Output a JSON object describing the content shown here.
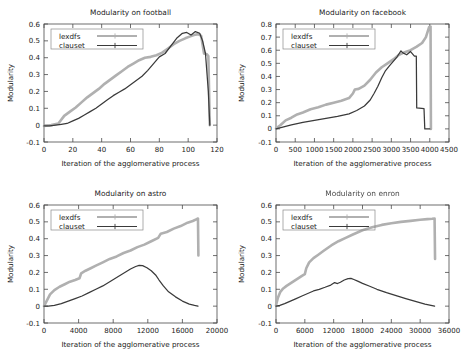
{
  "figure": {
    "panel_count": 4,
    "series_names": [
      "lexdfs",
      "clauset"
    ],
    "colors": {
      "lexdfs": "#b0b0b0",
      "clauset": "#3a3a3a",
      "axis": "#4a4a4a",
      "background": "#ffffff"
    }
  },
  "chart_data": [
    {
      "type": "line",
      "title": "Modularity on football",
      "xlabel": "Iteration of the agglomerative process",
      "ylabel": "Modularity",
      "xlim": [
        0,
        120
      ],
      "ylim": [
        -0.1,
        0.6
      ],
      "xticks": [
        0,
        20,
        40,
        60,
        80,
        100,
        120
      ],
      "yticks": [
        -0.1,
        0,
        0.1,
        0.2,
        0.3,
        0.4,
        0.5,
        0.6
      ],
      "grid": false,
      "legend_position": "top-left",
      "series": [
        {
          "name": "lexdfs",
          "x": [
            0,
            5,
            10,
            14,
            18,
            22,
            26,
            30,
            34,
            38,
            42,
            46,
            50,
            54,
            58,
            62,
            66,
            70,
            74,
            78,
            82,
            86,
            90,
            94,
            98,
            101,
            104,
            107,
            109,
            111,
            113,
            114,
            115
          ],
          "y": [
            -0.005,
            0.0,
            0.01,
            0.055,
            0.08,
            0.105,
            0.135,
            0.165,
            0.19,
            0.215,
            0.245,
            0.27,
            0.295,
            0.32,
            0.345,
            0.365,
            0.385,
            0.4,
            0.405,
            0.415,
            0.43,
            0.455,
            0.48,
            0.5,
            0.515,
            0.525,
            0.535,
            0.54,
            0.53,
            0.425,
            0.42,
            0.41,
            0.0
          ]
        },
        {
          "name": "clauset",
          "x": [
            0,
            4,
            8,
            12,
            16,
            20,
            24,
            28,
            32,
            36,
            40,
            44,
            48,
            52,
            56,
            60,
            64,
            68,
            72,
            76,
            80,
            84,
            88,
            92,
            96,
            99,
            102,
            105,
            108,
            110,
            112,
            114,
            115
          ],
          "y": [
            -0.005,
            -0.005,
            0.0,
            0.005,
            0.01,
            0.025,
            0.04,
            0.06,
            0.08,
            0.1,
            0.125,
            0.15,
            0.175,
            0.195,
            0.215,
            0.24,
            0.265,
            0.29,
            0.325,
            0.365,
            0.405,
            0.425,
            0.47,
            0.515,
            0.545,
            0.55,
            0.535,
            0.555,
            0.545,
            0.5,
            0.425,
            0.2,
            0.0
          ]
        }
      ]
    },
    {
      "type": "line",
      "title": "Modularity on facebook",
      "xlabel": "Iteration of the agglomerative process",
      "ylabel": "Modularity",
      "xlim": [
        0,
        4500
      ],
      "ylim": [
        -0.1,
        0.8
      ],
      "xticks": [
        0,
        500,
        1000,
        1500,
        2000,
        2500,
        3000,
        3500,
        4000,
        4500
      ],
      "yticks": [
        -0.1,
        0,
        0.1,
        0.2,
        0.3,
        0.4,
        0.5,
        0.6,
        0.7,
        0.8
      ],
      "grid": false,
      "legend_position": "top-left",
      "series": [
        {
          "name": "lexdfs",
          "x": [
            0,
            120,
            250,
            400,
            550,
            700,
            900,
            1100,
            1300,
            1500,
            1700,
            1900,
            2000,
            2050,
            2150,
            2300,
            2450,
            2600,
            2750,
            2900,
            3050,
            3200,
            3350,
            3500,
            3650,
            3800,
            3900,
            3980,
            4020,
            4030
          ],
          "y": [
            0.005,
            0.03,
            0.065,
            0.085,
            0.11,
            0.125,
            0.15,
            0.165,
            0.185,
            0.2,
            0.215,
            0.235,
            0.27,
            0.3,
            0.305,
            0.33,
            0.375,
            0.43,
            0.47,
            0.5,
            0.53,
            0.565,
            0.585,
            0.6,
            0.625,
            0.655,
            0.7,
            0.775,
            0.78,
            0.0
          ]
        },
        {
          "name": "clauset",
          "x": [
            0,
            200,
            400,
            700,
            1000,
            1300,
            1600,
            1900,
            2100,
            2300,
            2450,
            2550,
            2650,
            2750,
            2850,
            2950,
            3050,
            3150,
            3250,
            3300,
            3400,
            3500,
            3600,
            3650,
            3660,
            3850,
            3870,
            3990,
            4000
          ],
          "y": [
            0.0,
            0.015,
            0.03,
            0.05,
            0.065,
            0.08,
            0.095,
            0.115,
            0.14,
            0.175,
            0.22,
            0.27,
            0.325,
            0.39,
            0.445,
            0.48,
            0.515,
            0.55,
            0.595,
            0.58,
            0.565,
            0.59,
            0.555,
            0.555,
            0.16,
            0.155,
            0.0,
            0.0,
            0.0
          ]
        }
      ]
    },
    {
      "type": "line",
      "title": "Modularity on astro",
      "xlabel": "Iteration of the agglomerative process",
      "ylabel": "Modularity",
      "xlim": [
        0,
        20000
      ],
      "ylim": [
        -0.1,
        0.6
      ],
      "xticks": [
        0,
        4000,
        8000,
        12000,
        16000,
        20000
      ],
      "yticks": [
        -0.1,
        0,
        0.1,
        0.2,
        0.3,
        0.4,
        0.5,
        0.6
      ],
      "grid": false,
      "legend_position": "top-left",
      "series": [
        {
          "name": "lexdfs",
          "x": [
            0,
            300,
            700,
            1200,
            1800,
            2400,
            3000,
            3600,
            4100,
            4300,
            4800,
            5400,
            6000,
            6800,
            7600,
            8400,
            9200,
            10000,
            10800,
            11600,
            12400,
            13200,
            13500,
            14200,
            15000,
            15800,
            16600,
            17200,
            17600,
            17800,
            17850
          ],
          "y": [
            0.0,
            0.03,
            0.07,
            0.095,
            0.115,
            0.13,
            0.145,
            0.155,
            0.165,
            0.195,
            0.21,
            0.225,
            0.24,
            0.26,
            0.28,
            0.295,
            0.315,
            0.33,
            0.35,
            0.365,
            0.385,
            0.405,
            0.43,
            0.44,
            0.46,
            0.475,
            0.495,
            0.505,
            0.515,
            0.52,
            0.3
          ]
        },
        {
          "name": "clauset",
          "x": [
            0,
            500,
            1200,
            2000,
            2800,
            3600,
            4400,
            5200,
            6000,
            6800,
            7600,
            8400,
            9200,
            10000,
            10600,
            11000,
            11400,
            11900,
            12400,
            12900,
            13300,
            13800,
            14400,
            15200,
            16000,
            16800,
            17400,
            17800
          ],
          "y": [
            0.0,
            0.0,
            0.005,
            0.015,
            0.03,
            0.045,
            0.06,
            0.08,
            0.1,
            0.12,
            0.145,
            0.17,
            0.195,
            0.22,
            0.235,
            0.242,
            0.24,
            0.228,
            0.21,
            0.185,
            0.155,
            0.12,
            0.085,
            0.055,
            0.03,
            0.012,
            0.004,
            0.0
          ]
        }
      ]
    },
    {
      "type": "line",
      "title": "Modularity on enron",
      "xlabel": "Iteration of the agglomerative process",
      "ylabel": "Modularity",
      "xlim": [
        0,
        36000
      ],
      "ylim": [
        -0.1,
        0.6
      ],
      "xticks": [
        0,
        6000,
        12000,
        18000,
        24000,
        30000,
        36000
      ],
      "yticks": [
        -0.1,
        0,
        0.1,
        0.2,
        0.3,
        0.4,
        0.5,
        0.6
      ],
      "grid": false,
      "legend_position": "top-left",
      "series": [
        {
          "name": "lexdfs",
          "x": [
            0,
            400,
            900,
            1500,
            2200,
            3000,
            3800,
            4600,
            5400,
            6000,
            6300,
            6900,
            7800,
            8800,
            10000,
            11500,
            13000,
            14500,
            16000,
            18000,
            20000,
            22000,
            24000,
            26000,
            28000,
            30000,
            31500,
            32500,
            33000,
            33100
          ],
          "y": [
            0.005,
            0.05,
            0.085,
            0.105,
            0.12,
            0.135,
            0.15,
            0.165,
            0.18,
            0.19,
            0.225,
            0.26,
            0.285,
            0.305,
            0.33,
            0.36,
            0.385,
            0.405,
            0.425,
            0.45,
            0.468,
            0.482,
            0.492,
            0.5,
            0.506,
            0.512,
            0.516,
            0.518,
            0.52,
            0.28
          ]
        },
        {
          "name": "clauset",
          "x": [
            0,
            800,
            1800,
            3000,
            4200,
            5400,
            6600,
            7800,
            9000,
            10200,
            11400,
            12200,
            12800,
            13400,
            14200,
            15000,
            15600,
            16200,
            17000,
            18000,
            19500,
            21000,
            23000,
            25000,
            27000,
            29000,
            31000,
            32500,
            33000
          ],
          "y": [
            0.0,
            0.005,
            0.015,
            0.03,
            0.045,
            0.06,
            0.075,
            0.09,
            0.1,
            0.112,
            0.125,
            0.14,
            0.134,
            0.142,
            0.155,
            0.163,
            0.165,
            0.158,
            0.148,
            0.135,
            0.118,
            0.1,
            0.08,
            0.062,
            0.045,
            0.028,
            0.012,
            0.003,
            0.0
          ]
        }
      ]
    }
  ]
}
